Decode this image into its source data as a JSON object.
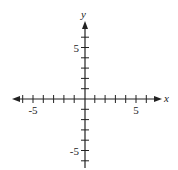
{
  "chart_data": {
    "type": "coordinate-plane",
    "title": "",
    "xlabel": "x",
    "ylabel": "y",
    "xlim": [
      -6,
      6
    ],
    "ylim": [
      -6,
      6
    ],
    "x_ticks": [
      -6,
      -5,
      -4,
      -3,
      -2,
      -1,
      1,
      2,
      3,
      4,
      5,
      6
    ],
    "y_ticks": [
      -6,
      -5,
      -4,
      -3,
      -2,
      -1,
      1,
      2,
      3,
      4,
      5,
      6
    ],
    "x_tick_labels": [
      {
        "value": -5,
        "label": "-5"
      },
      {
        "value": 5,
        "label": "5"
      }
    ],
    "y_tick_labels": [
      {
        "value": 5,
        "label": "5"
      },
      {
        "value": -5,
        "label": "-5"
      }
    ],
    "arrows": {
      "x_left": true,
      "x_right": true,
      "y_top": true,
      "y_bottom": false
    },
    "grid": false,
    "data": []
  },
  "colors": {
    "axis": "#222222",
    "background": "#ffffff"
  }
}
